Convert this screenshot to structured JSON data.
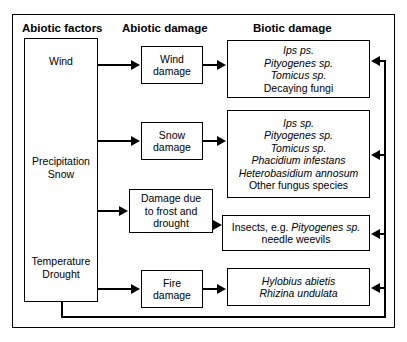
{
  "diagram": {
    "headers": {
      "col1": "Abiotic factors",
      "col2": "Abiotic damage",
      "col3": "Biotic damage"
    },
    "abiotic_factors": [
      {
        "id": "wind",
        "lines": [
          "Wind"
        ]
      },
      {
        "id": "precipitation-snow",
        "lines": [
          "Precipitation",
          "Snow"
        ]
      },
      {
        "id": "temperature-drought",
        "lines": [
          "Temperature",
          "Drought"
        ]
      }
    ],
    "abiotic_damage": [
      {
        "id": "wind-damage",
        "lines": [
          "Wind",
          "damage"
        ]
      },
      {
        "id": "snow-damage",
        "lines": [
          "Snow",
          "damage"
        ]
      },
      {
        "id": "frost-drought-damage",
        "lines": [
          "Damage due",
          "to frost and",
          "drought"
        ]
      },
      {
        "id": "fire-damage",
        "lines": [
          "Fire",
          "damage"
        ]
      }
    ],
    "biotic_damage": [
      {
        "id": "biotic-wind",
        "entries": [
          {
            "text": "Ips ps.",
            "italic": true
          },
          {
            "text": "Pityogenes sp.",
            "italic": true
          },
          {
            "text": "Tomicus sp.",
            "italic": true
          },
          {
            "text": "Decaying fungi",
            "italic": false
          }
        ]
      },
      {
        "id": "biotic-snow",
        "entries": [
          {
            "text": "Ips sp.",
            "italic": true
          },
          {
            "text": "Pityogenes sp.",
            "italic": true
          },
          {
            "text": "Tomicus sp.",
            "italic": true
          },
          {
            "text": "Phacidium infestans",
            "italic": true
          },
          {
            "text": "Heterobasidium annosum",
            "italic": true
          },
          {
            "text": "Other fungus species",
            "italic": false
          }
        ]
      },
      {
        "id": "biotic-frost",
        "line1_prefix": "Insects, e.g. ",
        "line1_italic": "Pityogenes sp.",
        "line2": "needle weevils"
      },
      {
        "id": "biotic-fire",
        "entries": [
          {
            "text": "Hylobius abietis",
            "italic": true
          },
          {
            "text": "Rhizina undulata",
            "italic": true
          }
        ]
      }
    ],
    "colors": {
      "line": "#000000",
      "background": "#ffffff"
    }
  }
}
